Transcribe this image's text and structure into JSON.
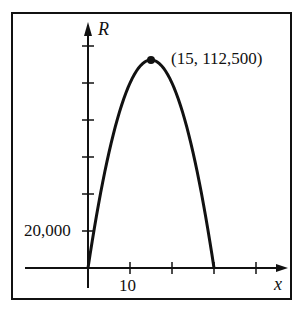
{
  "chart_data": {
    "type": "line",
    "title": "",
    "xlabel": "x",
    "ylabel": "R",
    "x_tick_label": "10",
    "y_tick_label": "20,000",
    "x_tick_step": 10,
    "y_tick_step": 20000,
    "xlim": [
      0,
      40
    ],
    "ylim": [
      0,
      120000
    ],
    "grid": false,
    "series": [
      {
        "name": "R",
        "x": [
          0,
          5,
          10,
          15,
          20,
          25,
          30
        ],
        "values": [
          0,
          62500,
          100000,
          112500,
          100000,
          62500,
          0
        ]
      }
    ],
    "annotations": [
      {
        "x": 15,
        "y": 112500,
        "text": "(15, 112,500)",
        "marker": "dot"
      }
    ]
  },
  "labels": {
    "y_axis": "R",
    "x_axis": "x",
    "y_tick": "20,000",
    "x_tick": "10",
    "vertex": "(15, 112,500)"
  }
}
